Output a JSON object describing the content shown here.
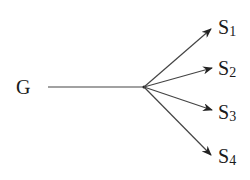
{
  "diagram": {
    "type": "fan-out arrow diagram",
    "source": {
      "id": "G",
      "label": "G"
    },
    "targets": [
      {
        "id": "S1",
        "main": "S",
        "sub": "1"
      },
      {
        "id": "S2",
        "main": "S",
        "sub": "2"
      },
      {
        "id": "S3",
        "main": "S",
        "sub": "3"
      },
      {
        "id": "S4",
        "main": "S",
        "sub": "4"
      }
    ],
    "edges": [
      {
        "from": "G",
        "to": "S1"
      },
      {
        "from": "G",
        "to": "S2"
      },
      {
        "from": "G",
        "to": "S3"
      },
      {
        "from": "G",
        "to": "S4"
      }
    ],
    "stroke_color": "#333333"
  }
}
